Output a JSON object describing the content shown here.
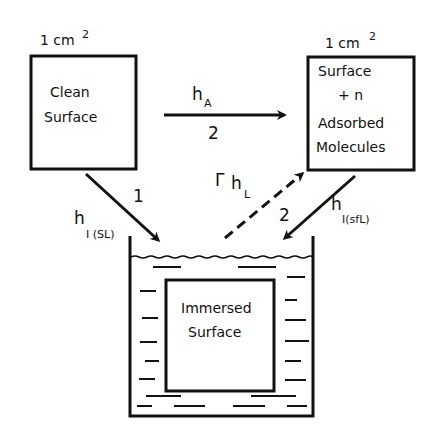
{
  "diagram": {
    "clean_box": {
      "area_label": "1 cm",
      "area_exp": "2",
      "line1": "Clean",
      "line2": "Surface"
    },
    "adsorbed_box": {
      "area_label": "1 cm",
      "area_exp": "2",
      "line1": "Surface",
      "line2": "+ n",
      "line3": "Adsorbed",
      "line4": "Molecules"
    },
    "immersed_box": {
      "line1": "Immersed",
      "line2": "Surface"
    },
    "arrows": {
      "adsorption": {
        "label": "h",
        "subscript": "A",
        "path_number": "2"
      },
      "immersion_clean": {
        "label": "h",
        "subscript": "I (SL)",
        "path_number": "1"
      },
      "immersion_adsorbed": {
        "label": "h",
        "subscript": "I(sfL)",
        "path_number": "2"
      },
      "liquid_return": {
        "prefix": "Γ",
        "label": "h",
        "subscript": "L",
        "style": "dashed"
      }
    },
    "colors": {
      "ink": "#111111",
      "background": "#ffffff"
    }
  }
}
